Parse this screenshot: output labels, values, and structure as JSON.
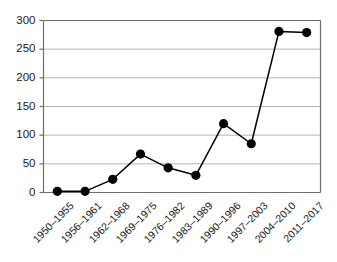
{
  "chart_data": {
    "type": "line",
    "title": "",
    "subtitle": "",
    "xlabel": "",
    "ylabel": "",
    "categories": [
      "1950–1955",
      "1956–1961",
      "1962–1968",
      "1969–1975",
      "1976–1982",
      "1983–1989",
      "1990–1996",
      "1997–2003",
      "2004–2010",
      "2011–2017"
    ],
    "values": [
      2,
      2,
      23,
      67,
      43,
      30,
      120,
      85,
      281,
      279
    ],
    "series": [
      {
        "name": "",
        "values": [
          2,
          2,
          23,
          67,
          43,
          30,
          120,
          85,
          281,
          279
        ]
      }
    ],
    "ylim": [
      0,
      300
    ],
    "yticks": [
      0,
      50,
      100,
      150,
      200,
      250,
      300
    ],
    "ytick_labels": [
      "0",
      "50",
      "100",
      "150",
      "200",
      "250",
      "300"
    ],
    "grid": "horizontal",
    "legend": "none",
    "marker": "filled-circle",
    "marker_color": "#000000",
    "line_color": "#000000",
    "grid_color": "#b5b5b5",
    "axis_color": "#6e6e6e",
    "background": "#ffffff"
  }
}
